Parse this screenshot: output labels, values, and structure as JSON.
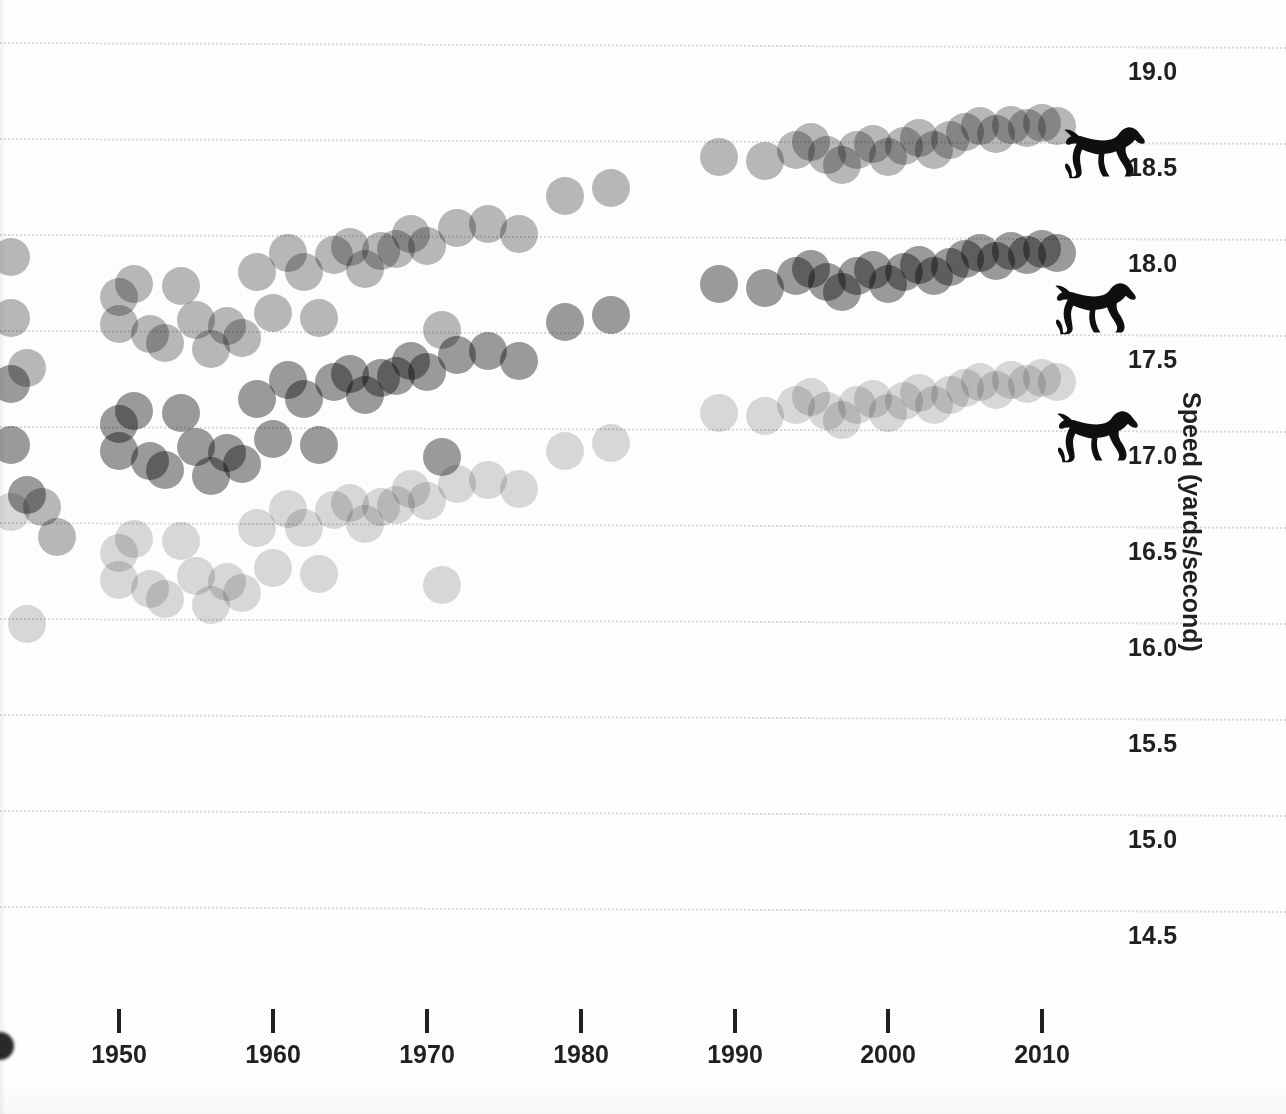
{
  "figure": {
    "kind": "scatter-strip-chart",
    "background_color": "#fdfdfd",
    "ink_color": "#231f20"
  },
  "yaxis": {
    "title": "Speed (yards/second)",
    "tick_labels": [
      "19.0",
      "18.5",
      "18.0",
      "17.5",
      "17.0",
      "16.5",
      "16.0",
      "15.5",
      "15.0",
      "14.5"
    ],
    "tick_values": [
      19.0,
      18.5,
      18.0,
      17.5,
      17.0,
      16.5,
      16.0,
      15.5,
      15.0,
      14.5
    ],
    "tick_pixels_y": [
      42,
      138,
      234,
      330,
      426,
      522,
      618,
      714,
      810,
      906
    ],
    "label_offset_px": 28
  },
  "xaxis": {
    "tick_labels": [
      "1950",
      "1960",
      "1970",
      "1980",
      "1990",
      "2000",
      "2010"
    ],
    "tick_values": [
      1950,
      1960,
      1970,
      1980,
      1990,
      2000,
      2010
    ],
    "tick_pixels_x": [
      119,
      273,
      427,
      581,
      735,
      888,
      1042
    ]
  },
  "series_colors": {
    "top": "#b9b9b9",
    "middle": "#9b9b9b",
    "bottom": "#d9d9d9"
  },
  "markers": {
    "horse_icon_name": "galloping-horse-icon",
    "horse_color": "#0f0f0f",
    "positions": [
      {
        "series": "top",
        "x": 1062,
        "y": 116
      },
      {
        "series": "middle",
        "x": 1053,
        "y": 272
      },
      {
        "series": "bottom",
        "x": 1055,
        "y": 400
      }
    ]
  },
  "chart_data": {
    "type": "scatter",
    "title": "",
    "subtitle": "",
    "xlabel": "",
    "ylabel": "Speed (yards/second)",
    "xlim": [
      1942,
      2013
    ],
    "ylim": [
      14.3,
      19.3
    ],
    "grid": true,
    "grid_axis": "y",
    "legend": "none",
    "legend_position": "none",
    "annotations": [
      {
        "text": "galloping horse silhouette at end of top series",
        "x": 2011,
        "y": 18.55
      },
      {
        "text": "galloping horse silhouette at end of middle series",
        "x": 2011,
        "y": 17.72
      },
      {
        "text": "galloping horse silhouette at end of bottom series",
        "x": 2011,
        "y": 17.05
      }
    ],
    "note": "Three race series share identical year sampling and identical relative speed pattern; each series is plotted at a different vertical offset and a different gray tone.",
    "series": [
      {
        "name": "top",
        "color": "#b9b9b9",
        "y_offset": 0.0,
        "points": [
          {
            "year": 1943,
            "speed": 17.88
          },
          {
            "year": 1943,
            "speed": 17.56
          },
          {
            "year": 1944,
            "speed": 17.3
          },
          {
            "year": 1945,
            "speed": 16.58
          },
          {
            "year": 1946,
            "speed": 16.42
          },
          {
            "year": 1950,
            "speed": 17.67
          },
          {
            "year": 1950,
            "speed": 17.53
          },
          {
            "year": 1951,
            "speed": 17.74
          },
          {
            "year": 1952,
            "speed": 17.48
          },
          {
            "year": 1953,
            "speed": 17.43
          },
          {
            "year": 1954,
            "speed": 17.73
          },
          {
            "year": 1955,
            "speed": 17.55
          },
          {
            "year": 1956,
            "speed": 17.4
          },
          {
            "year": 1957,
            "speed": 17.52
          },
          {
            "year": 1958,
            "speed": 17.46
          },
          {
            "year": 1959,
            "speed": 17.8
          },
          {
            "year": 1960,
            "speed": 17.59
          },
          {
            "year": 1961,
            "speed": 17.9
          },
          {
            "year": 1962,
            "speed": 17.8
          },
          {
            "year": 1963,
            "speed": 17.56
          },
          {
            "year": 1964,
            "speed": 17.89
          },
          {
            "year": 1965,
            "speed": 17.93
          },
          {
            "year": 1966,
            "speed": 17.82
          },
          {
            "year": 1967,
            "speed": 17.91
          },
          {
            "year": 1968,
            "speed": 17.92
          },
          {
            "year": 1969,
            "speed": 18.0
          },
          {
            "year": 1970,
            "speed": 17.94
          },
          {
            "year": 1971,
            "speed": 17.5
          },
          {
            "year": 1972,
            "speed": 18.03
          },
          {
            "year": 1974,
            "speed": 18.05
          },
          {
            "year": 1976,
            "speed": 18.0
          },
          {
            "year": 1979,
            "speed": 18.2
          },
          {
            "year": 1982,
            "speed": 18.24
          },
          {
            "year": 1989,
            "speed": 18.4
          },
          {
            "year": 1992,
            "speed": 18.38
          },
          {
            "year": 1994,
            "speed": 18.44
          },
          {
            "year": 1995,
            "speed": 18.48
          },
          {
            "year": 1996,
            "speed": 18.41
          },
          {
            "year": 1997,
            "speed": 18.36
          },
          {
            "year": 1998,
            "speed": 18.44
          },
          {
            "year": 1999,
            "speed": 18.47
          },
          {
            "year": 2000,
            "speed": 18.4
          },
          {
            "year": 2001,
            "speed": 18.46
          },
          {
            "year": 2002,
            "speed": 18.5
          },
          {
            "year": 2003,
            "speed": 18.44
          },
          {
            "year": 2004,
            "speed": 18.49
          },
          {
            "year": 2005,
            "speed": 18.53
          },
          {
            "year": 2006,
            "speed": 18.56
          },
          {
            "year": 2007,
            "speed": 18.52
          },
          {
            "year": 2008,
            "speed": 18.57
          },
          {
            "year": 2009,
            "speed": 18.55
          },
          {
            "year": 2010,
            "speed": 18.58
          },
          {
            "year": 2011,
            "speed": 18.56
          }
        ]
      },
      {
        "name": "middle",
        "color": "#9b9b9b",
        "y_offset": -0.66,
        "points": [
          {
            "year": 1943,
            "speed": 17.22
          },
          {
            "year": 1943,
            "speed": 16.9
          },
          {
            "year": 1944,
            "speed": 16.64
          },
          {
            "year": 1950,
            "speed": 17.01
          },
          {
            "year": 1950,
            "speed": 16.87
          },
          {
            "year": 1951,
            "speed": 17.08
          },
          {
            "year": 1952,
            "speed": 16.82
          },
          {
            "year": 1953,
            "speed": 16.77
          },
          {
            "year": 1954,
            "speed": 17.07
          },
          {
            "year": 1955,
            "speed": 16.89
          },
          {
            "year": 1956,
            "speed": 16.74
          },
          {
            "year": 1957,
            "speed": 16.86
          },
          {
            "year": 1958,
            "speed": 16.8
          },
          {
            "year": 1959,
            "speed": 17.14
          },
          {
            "year": 1960,
            "speed": 16.93
          },
          {
            "year": 1961,
            "speed": 17.24
          },
          {
            "year": 1962,
            "speed": 17.14
          },
          {
            "year": 1963,
            "speed": 16.9
          },
          {
            "year": 1964,
            "speed": 17.23
          },
          {
            "year": 1965,
            "speed": 17.27
          },
          {
            "year": 1966,
            "speed": 17.16
          },
          {
            "year": 1967,
            "speed": 17.25
          },
          {
            "year": 1968,
            "speed": 17.26
          },
          {
            "year": 1969,
            "speed": 17.34
          },
          {
            "year": 1970,
            "speed": 17.28
          },
          {
            "year": 1971,
            "speed": 16.84
          },
          {
            "year": 1972,
            "speed": 17.37
          },
          {
            "year": 1974,
            "speed": 17.39
          },
          {
            "year": 1976,
            "speed": 17.34
          },
          {
            "year": 1979,
            "speed": 17.54
          },
          {
            "year": 1982,
            "speed": 17.58
          },
          {
            "year": 1989,
            "speed": 17.74
          },
          {
            "year": 1992,
            "speed": 17.72
          },
          {
            "year": 1994,
            "speed": 17.78
          },
          {
            "year": 1995,
            "speed": 17.82
          },
          {
            "year": 1996,
            "speed": 17.75
          },
          {
            "year": 1997,
            "speed": 17.7
          },
          {
            "year": 1998,
            "speed": 17.78
          },
          {
            "year": 1999,
            "speed": 17.81
          },
          {
            "year": 2000,
            "speed": 17.74
          },
          {
            "year": 2001,
            "speed": 17.8
          },
          {
            "year": 2002,
            "speed": 17.84
          },
          {
            "year": 2003,
            "speed": 17.78
          },
          {
            "year": 2004,
            "speed": 17.83
          },
          {
            "year": 2005,
            "speed": 17.87
          },
          {
            "year": 2006,
            "speed": 17.9
          },
          {
            "year": 2007,
            "speed": 17.86
          },
          {
            "year": 2008,
            "speed": 17.91
          },
          {
            "year": 2009,
            "speed": 17.89
          },
          {
            "year": 2010,
            "speed": 17.92
          },
          {
            "year": 2011,
            "speed": 17.9
          }
        ]
      },
      {
        "name": "bottom",
        "color": "#d9d9d9",
        "y_offset": -1.33,
        "points": [
          {
            "year": 1943,
            "speed": 16.55
          },
          {
            "year": 1944,
            "speed": 15.97
          },
          {
            "year": 1950,
            "speed": 16.34
          },
          {
            "year": 1950,
            "speed": 16.2
          },
          {
            "year": 1951,
            "speed": 16.41
          },
          {
            "year": 1952,
            "speed": 16.15
          },
          {
            "year": 1953,
            "speed": 16.1
          },
          {
            "year": 1954,
            "speed": 16.4
          },
          {
            "year": 1955,
            "speed": 16.22
          },
          {
            "year": 1956,
            "speed": 16.07
          },
          {
            "year": 1957,
            "speed": 16.19
          },
          {
            "year": 1958,
            "speed": 16.13
          },
          {
            "year": 1959,
            "speed": 16.47
          },
          {
            "year": 1960,
            "speed": 16.26
          },
          {
            "year": 1961,
            "speed": 16.57
          },
          {
            "year": 1962,
            "speed": 16.47
          },
          {
            "year": 1963,
            "speed": 16.23
          },
          {
            "year": 1964,
            "speed": 16.56
          },
          {
            "year": 1965,
            "speed": 16.6
          },
          {
            "year": 1966,
            "speed": 16.49
          },
          {
            "year": 1967,
            "speed": 16.58
          },
          {
            "year": 1968,
            "speed": 16.59
          },
          {
            "year": 1969,
            "speed": 16.67
          },
          {
            "year": 1970,
            "speed": 16.61
          },
          {
            "year": 1971,
            "speed": 16.17
          },
          {
            "year": 1972,
            "speed": 16.7
          },
          {
            "year": 1974,
            "speed": 16.72
          },
          {
            "year": 1976,
            "speed": 16.67
          },
          {
            "year": 1979,
            "speed": 16.87
          },
          {
            "year": 1982,
            "speed": 16.91
          },
          {
            "year": 1989,
            "speed": 17.07
          },
          {
            "year": 1992,
            "speed": 17.05
          },
          {
            "year": 1994,
            "speed": 17.11
          },
          {
            "year": 1995,
            "speed": 17.15
          },
          {
            "year": 1996,
            "speed": 17.08
          },
          {
            "year": 1997,
            "speed": 17.03
          },
          {
            "year": 1998,
            "speed": 17.11
          },
          {
            "year": 1999,
            "speed": 17.14
          },
          {
            "year": 2000,
            "speed": 17.07
          },
          {
            "year": 2001,
            "speed": 17.13
          },
          {
            "year": 2002,
            "speed": 17.17
          },
          {
            "year": 2003,
            "speed": 17.11
          },
          {
            "year": 2004,
            "speed": 17.16
          },
          {
            "year": 2005,
            "speed": 17.2
          },
          {
            "year": 2006,
            "speed": 17.23
          },
          {
            "year": 2007,
            "speed": 17.19
          },
          {
            "year": 2008,
            "speed": 17.24
          },
          {
            "year": 2009,
            "speed": 17.22
          },
          {
            "year": 2010,
            "speed": 17.25
          },
          {
            "year": 2011,
            "speed": 17.23
          }
        ]
      }
    ]
  }
}
